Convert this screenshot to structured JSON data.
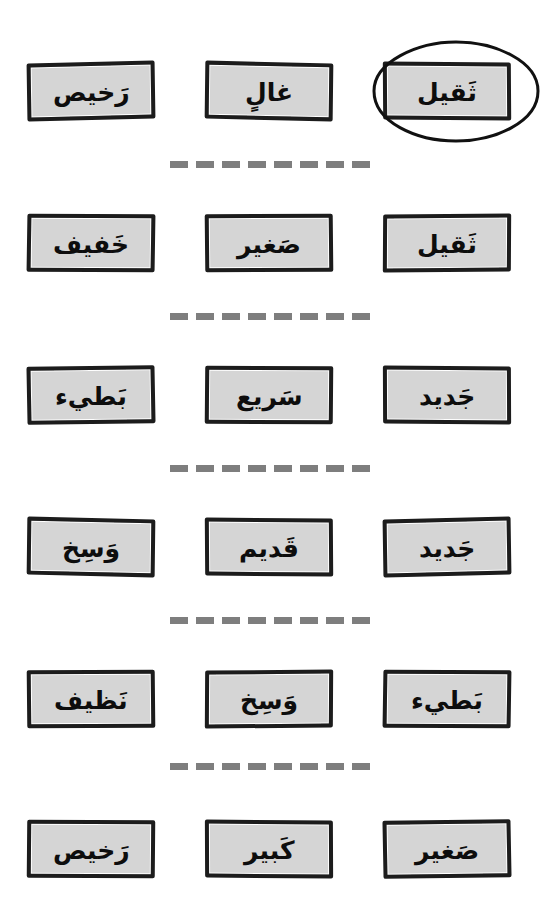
{
  "page": {
    "background_color": "#ffffff",
    "card_fill_color": "#d5d5d5",
    "card_border_color": "#1c1c1c",
    "divider_color": "#7e7e7e",
    "annotation_color": "#111111"
  },
  "annotation": {
    "shape": "ellipse",
    "target_row": 1,
    "target_column": 3,
    "target_word": "ثَقيل"
  },
  "rows": [
    {
      "index": 1,
      "cards": [
        {
          "word": "رَخيص",
          "column": 1
        },
        {
          "word": "غالٍ",
          "column": 2
        },
        {
          "word": "ثَقيل",
          "column": 3,
          "circled": true
        }
      ]
    },
    {
      "index": 2,
      "cards": [
        {
          "word": "خَفيف",
          "column": 1
        },
        {
          "word": "صَغير",
          "column": 2
        },
        {
          "word": "ثَقيل",
          "column": 3
        }
      ]
    },
    {
      "index": 3,
      "cards": [
        {
          "word": "بَطيء",
          "column": 1
        },
        {
          "word": "سَريع",
          "column": 2
        },
        {
          "word": "جَديد",
          "column": 3
        }
      ]
    },
    {
      "index": 4,
      "cards": [
        {
          "word": "وَسِخ",
          "column": 1
        },
        {
          "word": "قَديم",
          "column": 2
        },
        {
          "word": "جَديد",
          "column": 3
        }
      ]
    },
    {
      "index": 5,
      "cards": [
        {
          "word": "نَظيف",
          "column": 1
        },
        {
          "word": "وَسِخ",
          "column": 2
        },
        {
          "word": "بَطيء",
          "column": 3
        }
      ]
    },
    {
      "index": 6,
      "cards": [
        {
          "word": "رَخيص",
          "column": 1
        },
        {
          "word": "كَبير",
          "column": 2
        },
        {
          "word": "صَغير",
          "column": 3
        }
      ]
    }
  ],
  "dividers": [
    {
      "index": 1,
      "dash_count": 8
    },
    {
      "index": 2,
      "dash_count": 8
    },
    {
      "index": 3,
      "dash_count": 8
    },
    {
      "index": 4,
      "dash_count": 8
    },
    {
      "index": 5,
      "dash_count": 8
    }
  ]
}
